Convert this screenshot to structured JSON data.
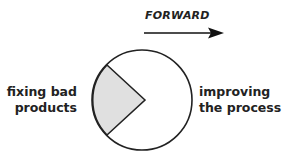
{
  "direction": {
    "label": "FORWARD",
    "arrow": "right-arrow"
  },
  "left_label": {
    "line1": "fixing bad",
    "line2": "products"
  },
  "right_label": {
    "line1": "improving",
    "line2": "the process"
  },
  "pie": {
    "slices": [
      {
        "name": "fixing bad products",
        "fraction_approx": 0.25,
        "fill": "#e0e0e0"
      },
      {
        "name": "improving the process",
        "fraction_approx": 0.75,
        "fill": "#ffffff"
      }
    ],
    "stroke": "#222222"
  }
}
